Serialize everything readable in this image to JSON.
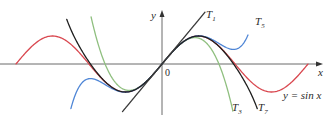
{
  "chart_data": {
    "type": "line",
    "title": "",
    "xlabel": "x",
    "ylabel": "y",
    "origin_label": "0",
    "xlim": [
      -6.28,
      6.28
    ],
    "ylim": [
      -1.8,
      2.3
    ],
    "grid": false,
    "legend": "inline labels",
    "series": [
      {
        "name": "y = sin x",
        "label": "y = sin x",
        "color": "#d9474f",
        "func": "sin",
        "domain": [
          -6.28,
          6.28
        ]
      },
      {
        "name": "T1",
        "label_main": "T",
        "label_sub": "1",
        "color": "#3a3a3a",
        "terms": 1,
        "domain": [
          -1.7,
          1.85
        ]
      },
      {
        "name": "T3",
        "label_main": "T",
        "label_sub": "3",
        "color": "#8fbf7f",
        "terms": 3,
        "domain": [
          -3.05,
          3.05
        ]
      },
      {
        "name": "T5",
        "label_main": "T",
        "label_sub": "5",
        "color": "#4f86d6",
        "terms": 5,
        "domain": [
          -3.92,
          3.7
        ]
      },
      {
        "name": "T7",
        "label_main": "T",
        "label_sub": "7",
        "color": "#1f1f1f",
        "terms": 7,
        "domain": [
          -4.1,
          4.1
        ]
      }
    ],
    "annotations": [
      {
        "text": "T1",
        "x": 1.92,
        "y": 2.0
      },
      {
        "text": "T5",
        "x": 3.8,
        "y": 1.75
      },
      {
        "text": "T3",
        "x": 3.05,
        "y": -1.7
      },
      {
        "text": "T7",
        "x": 4.0,
        "y": -1.7
      },
      {
        "text": "y = sin x",
        "x": 4.75,
        "y": -1.15
      }
    ]
  },
  "layout": {
    "origin_px": [
      162,
      64
    ],
    "sx": 23.24,
    "sy": 28
  }
}
